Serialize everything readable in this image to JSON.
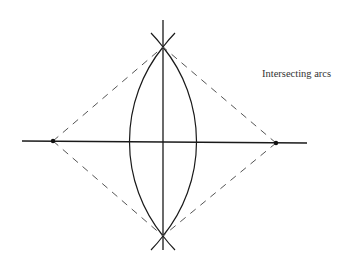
{
  "figure": {
    "label": "Intersecting arcs",
    "colors": {
      "background": "#ffffff",
      "line": "#1a1a1a",
      "dashed": "#555555",
      "text": "#333333"
    },
    "geometry": {
      "horizontal_line": {
        "x1": 22,
        "y1": 141,
        "x2": 307,
        "y2": 143
      },
      "vertical_line": {
        "x1": 163,
        "y1": 20,
        "x2": 163,
        "y2": 250
      },
      "left_point": {
        "x": 53,
        "y": 141
      },
      "right_point": {
        "x": 276,
        "y": 143
      },
      "top_intersection": {
        "x": 163,
        "y": 47
      },
      "bottom_intersection": {
        "x": 163,
        "y": 236
      },
      "lens_left_x": 130,
      "lens_right_x": 197
    }
  }
}
